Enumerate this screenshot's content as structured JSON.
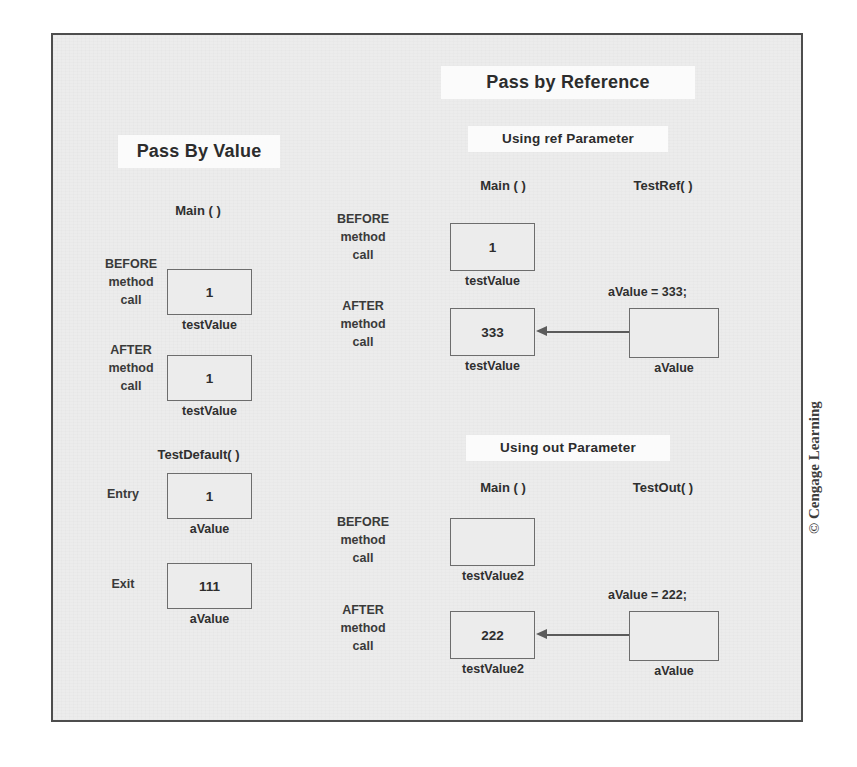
{
  "figure": {
    "background_color": "#ececec",
    "border_color": "#4d4d4d",
    "box_border_color": "#6d6d6d",
    "text_color": "#2f2f2f",
    "arrow_color": "#5b5b5b",
    "credit": "© Cengage Learning"
  },
  "left_panel": {
    "title": "Pass By Value",
    "main_header": "Main ( )",
    "before_label_line1": "BEFORE",
    "before_label_line2": "method",
    "before_label_line3": "call",
    "after_label_line1": "AFTER",
    "after_label_line2": "method",
    "after_label_line3": "call",
    "before_box_value": "1",
    "before_box_name": "testValue",
    "after_box_value": "1",
    "after_box_name": "testValue",
    "method_header": "TestDefault( )",
    "entry_label": "Entry",
    "entry_box_value": "1",
    "entry_box_name": "aValue",
    "exit_label": "Exit",
    "exit_box_value": "111",
    "exit_box_name": "aValue"
  },
  "right_panel": {
    "title": "Pass by Reference",
    "ref_section": {
      "subtitle": "Using ref Parameter",
      "caller_header": "Main ( )",
      "callee_header": "TestRef( )",
      "before_label_line1": "BEFORE",
      "before_label_line2": "method",
      "before_label_line3": "call",
      "after_label_line1": "AFTER",
      "after_label_line2": "method",
      "after_label_line3": "call",
      "before_box_value": "1",
      "before_box_name": "testValue",
      "after_box_value": "333",
      "after_box_name": "testValue",
      "assignment": "aValue = 333;",
      "param_box_value": "",
      "param_box_name": "aValue"
    },
    "out_section": {
      "subtitle": "Using out Parameter",
      "caller_header": "Main ( )",
      "callee_header": "TestOut( )",
      "before_label_line1": "BEFORE",
      "before_label_line2": "method",
      "before_label_line3": "call",
      "after_label_line1": "AFTER",
      "after_label_line2": "method",
      "after_label_line3": "call",
      "before_box_value": "",
      "before_box_name": "testValue2",
      "after_box_value": "222",
      "after_box_name": "testValue2",
      "assignment": "aValue = 222;",
      "param_box_value": "",
      "param_box_name": "aValue"
    }
  }
}
